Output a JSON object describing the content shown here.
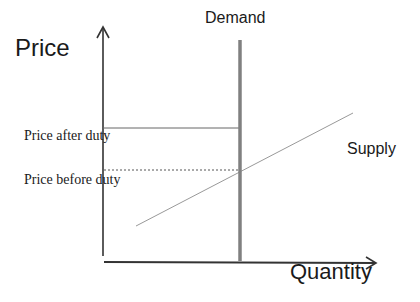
{
  "diagram": {
    "type": "supply-demand",
    "labels": {
      "y_axis": "Price",
      "x_axis": "Quantity",
      "demand": "Demand",
      "supply": "Supply",
      "price_after_duty": "Price after duty",
      "price_before_duty": "Price before duty"
    },
    "colors": {
      "axis": "#333333",
      "demand_line": "#808080",
      "supply_line": "#999999",
      "price_after_line": "#666666",
      "price_before_line": "#555555",
      "text": "#1a1a1a"
    },
    "elements": {
      "y_axis": {
        "x": 103,
        "y_top": 27,
        "y_bottom": 256
      },
      "x_axis": {
        "y": 262,
        "x_left": 104,
        "x_right": 376
      },
      "demand": {
        "x": 240,
        "y_top": 40,
        "y_bottom": 261,
        "style": "thick vertical (perfectly inelastic)"
      },
      "supply": {
        "x1": 136,
        "y1": 226,
        "x2": 353,
        "y2": 113,
        "style": "thin upward-sloping"
      },
      "price_after_duty": {
        "y": 128,
        "x_left": 103,
        "x_right": 240,
        "style": "solid"
      },
      "price_before_duty": {
        "y": 170,
        "x_left": 103,
        "x_right": 240,
        "style": "dashed"
      }
    }
  }
}
